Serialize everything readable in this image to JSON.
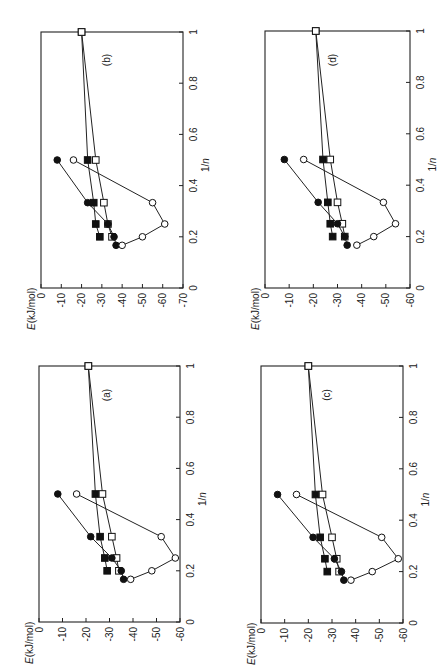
{
  "figure": {
    "orientation": "rotated 90 degrees",
    "panel_layout": "2x2"
  },
  "chart_data": [
    {
      "panel": "(a)",
      "type": "line",
      "xlabel": "1/n",
      "ylabel": "E(kJ/mol)",
      "x_ticks": [
        "0",
        "0.2",
        "0.4",
        "0.6",
        "0.8",
        "1"
      ],
      "y_ticks": [
        "0",
        "-10",
        "-20",
        "-30",
        "-40",
        "-50",
        "-60"
      ],
      "xlim": [
        0,
        1
      ],
      "ylim": [
        -60,
        0
      ],
      "series": [
        {
          "name": "filled circles",
          "marker": "filled-circle",
          "x": [
            0.1667,
            0.2,
            0.25,
            0.3333,
            0.5
          ],
          "values": [
            -36,
            -35,
            -31,
            -22,
            -8
          ]
        },
        {
          "name": "open circles",
          "marker": "open-circle",
          "x": [
            0.1667,
            0.2,
            0.25,
            0.3333,
            0.5
          ],
          "values": [
            -39,
            -48,
            -58,
            -52,
            -16
          ]
        },
        {
          "name": "filled squares",
          "marker": "filled-square",
          "x": [
            0.2,
            0.25,
            0.3333,
            0.5,
            1.0
          ],
          "values": [
            -29,
            -28,
            -26,
            -24,
            -21
          ]
        },
        {
          "name": "open squares",
          "marker": "open-square",
          "x": [
            0.2,
            0.25,
            0.3333,
            0.5,
            1.0
          ],
          "values": [
            -34,
            -33,
            -31,
            -27,
            -21
          ]
        }
      ]
    },
    {
      "panel": "(b)",
      "type": "line",
      "xlabel": "1/n",
      "ylabel": "E(kJ/mol)",
      "x_ticks": [
        "0",
        "0.2",
        "0.4",
        "0.6",
        "0.8",
        "1"
      ],
      "y_ticks": [
        "0",
        "-10",
        "-20",
        "-30",
        "-40",
        "-50",
        "-60",
        "-70"
      ],
      "xlim": [
        0,
        1
      ],
      "ylim": [
        -70,
        0
      ],
      "series": [
        {
          "name": "filled circles",
          "marker": "filled-circle",
          "x": [
            0.1667,
            0.2,
            0.25,
            0.3333,
            0.5
          ],
          "values": [
            -37,
            -36,
            -33,
            -23,
            -8
          ]
        },
        {
          "name": "open circles",
          "marker": "open-circle",
          "x": [
            0.1667,
            0.2,
            0.25,
            0.3333,
            0.5
          ],
          "values": [
            -40,
            -50,
            -61,
            -55,
            -16
          ]
        },
        {
          "name": "filled squares",
          "marker": "filled-square",
          "x": [
            0.2,
            0.25,
            0.3333,
            0.5,
            1.0
          ],
          "values": [
            -29,
            -27,
            -26,
            -23,
            -20
          ]
        },
        {
          "name": "open squares",
          "marker": "open-square",
          "x": [
            0.2,
            0.25,
            0.3333,
            0.5,
            1.0
          ],
          "values": [
            -35,
            -33,
            -31,
            -27,
            -20
          ]
        }
      ]
    },
    {
      "panel": "(c)",
      "type": "line",
      "xlabel": "1/n",
      "ylabel": "E(kJ/mol)",
      "x_ticks": [
        "0",
        "0.2",
        "0.4",
        "0.6",
        "0.8",
        "1"
      ],
      "y_ticks": [
        "0",
        "-10",
        "-20",
        "-30",
        "-40",
        "-50",
        "-60"
      ],
      "xlim": [
        0,
        1
      ],
      "ylim": [
        -60,
        0
      ],
      "series": [
        {
          "name": "filled circles",
          "marker": "filled-circle",
          "x": [
            0.1667,
            0.2,
            0.25,
            0.3333,
            0.5
          ],
          "values": [
            -35,
            -34,
            -31,
            -22,
            -7
          ]
        },
        {
          "name": "open circles",
          "marker": "open-circle",
          "x": [
            0.1667,
            0.2,
            0.25,
            0.3333,
            0.5
          ],
          "values": [
            -38,
            -47,
            -58,
            -51,
            -15
          ]
        },
        {
          "name": "filled squares",
          "marker": "filled-square",
          "x": [
            0.2,
            0.25,
            0.3333,
            0.5,
            1.0
          ],
          "values": [
            -28,
            -27,
            -25,
            -23,
            -20
          ]
        },
        {
          "name": "open squares",
          "marker": "open-square",
          "x": [
            0.2,
            0.25,
            0.3333,
            0.5,
            1.0
          ],
          "values": [
            -33,
            -32,
            -30,
            -26,
            -20
          ]
        }
      ]
    },
    {
      "panel": "(d)",
      "type": "line",
      "xlabel": "1/n",
      "ylabel": "E(kJ/mol)",
      "x_ticks": [
        "0",
        "0.2",
        "0.4",
        "0.6",
        "0.8",
        "1"
      ],
      "y_ticks": [
        "0",
        "-10",
        "-20",
        "-30",
        "-40",
        "-50",
        "-60"
      ],
      "xlim": [
        0,
        1
      ],
      "ylim": [
        -60,
        0
      ],
      "series": [
        {
          "name": "filled circles",
          "marker": "filled-circle",
          "x": [
            0.1667,
            0.2,
            0.25,
            0.3333,
            0.5
          ],
          "values": [
            -34,
            -33,
            -30,
            -22,
            -8
          ]
        },
        {
          "name": "open circles",
          "marker": "open-circle",
          "x": [
            0.1667,
            0.2,
            0.25,
            0.3333,
            0.5
          ],
          "values": [
            -38,
            -45,
            -54,
            -49,
            -16
          ]
        },
        {
          "name": "filled squares",
          "marker": "filled-square",
          "x": [
            0.2,
            0.25,
            0.3333,
            0.5,
            1.0
          ],
          "values": [
            -28,
            -27,
            -26,
            -24,
            -21
          ]
        },
        {
          "name": "open squares",
          "marker": "open-square",
          "x": [
            0.2,
            0.25,
            0.3333,
            0.5,
            1.0
          ],
          "values": [
            -33,
            -32,
            -30,
            -27,
            -21
          ]
        }
      ]
    }
  ],
  "geometry": [
    {
      "panel": "(a)",
      "e0x": 39,
      "eMinX": 180,
      "yTop": 366,
      "yBot": 622,
      "labelX": 110,
      "labelY": 395
    },
    {
      "panel": "(b)",
      "e0x": 41,
      "eMinX": 183,
      "yTop": 32,
      "yBot": 288,
      "labelX": 110,
      "labelY": 60
    },
    {
      "panel": "(c)",
      "e0x": 261,
      "eMinX": 403,
      "yTop": 366,
      "yBot": 623,
      "labelX": 330,
      "labelY": 395
    },
    {
      "panel": "(d)",
      "e0x": 265,
      "eMinX": 410,
      "yTop": 31,
      "yBot": 288,
      "labelX": 336,
      "labelY": 60
    }
  ]
}
